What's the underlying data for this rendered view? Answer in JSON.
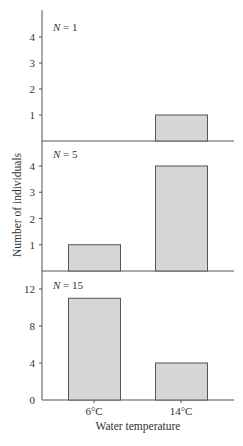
{
  "chart_data": {
    "type": "bar",
    "layout": "three vertically stacked panels sharing x-axis",
    "categories": [
      "6°C",
      "14°C"
    ],
    "xlabel": "Water temperature",
    "ylabel": "Number of individuals",
    "grid": false,
    "legend": null,
    "panels": [
      {
        "annotation": "N = 1",
        "n_prefix": "N",
        "n_value": "= 1",
        "values": [
          0,
          1
        ],
        "yticks": [
          1,
          2,
          3,
          4
        ],
        "ylim": [
          0,
          4.7
        ]
      },
      {
        "annotation": "N = 5",
        "n_prefix": "N",
        "n_value": "= 5",
        "values": [
          1,
          4
        ],
        "yticks": [
          1,
          2,
          3,
          4
        ],
        "ylim": [
          0,
          4.7
        ]
      },
      {
        "annotation": "N = 15",
        "n_prefix": "N",
        "n_value": "= 15",
        "values": [
          11,
          4
        ],
        "yticks": [
          0,
          4,
          8,
          12
        ],
        "ylim": [
          0,
          13
        ]
      }
    ],
    "colors": {
      "bar_fill": "#d6d6d6",
      "bar_stroke": "#555555",
      "axis": "#555555"
    }
  }
}
